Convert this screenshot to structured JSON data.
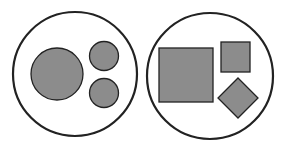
{
  "diagram": {
    "type": "two-group shape comparison",
    "colors": {
      "background": "#ffffff",
      "outline": "#222222",
      "fill": "#8c8c8c"
    },
    "stroke_widths": {
      "container": 2.2,
      "shape": 1.3
    },
    "groups": [
      {
        "id": "circles-group",
        "container": {
          "shape": "circle",
          "cx": 75,
          "cy": 74,
          "r": 62
        },
        "members": [
          {
            "shape": "circle",
            "size": "large",
            "cx": 57,
            "cy": 74,
            "r": 26
          },
          {
            "shape": "circle",
            "size": "small",
            "cx": 104,
            "cy": 56,
            "r": 14.5
          },
          {
            "shape": "circle",
            "size": "small",
            "cx": 104,
            "cy": 93,
            "r": 14.5
          }
        ]
      },
      {
        "id": "squares-group",
        "container": {
          "shape": "circle",
          "cx": 210,
          "cy": 76,
          "r": 63
        },
        "members": [
          {
            "shape": "square",
            "size": "large",
            "x": 159,
            "y": 48,
            "w": 54,
            "h": 54
          },
          {
            "shape": "square",
            "size": "small",
            "x": 221,
            "y": 42,
            "w": 29,
            "h": 30
          },
          {
            "shape": "diamond",
            "size": "small",
            "cx": 238,
            "cy": 98,
            "half": 20
          }
        ]
      }
    ]
  }
}
